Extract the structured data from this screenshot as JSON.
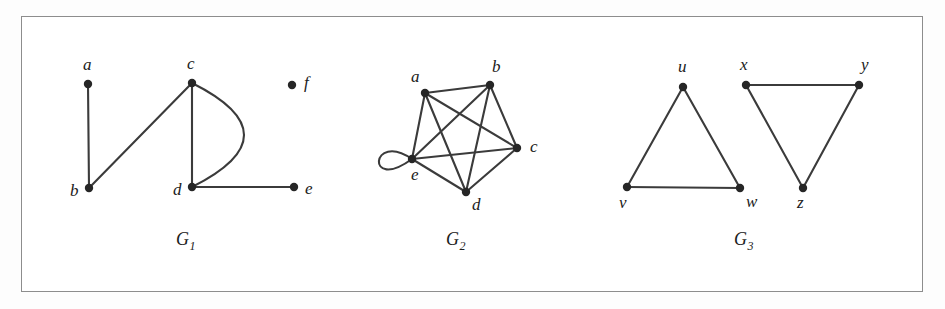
{
  "figure": {
    "background_color": "#fdfdfd",
    "frame_color": "#8d8d8d",
    "edge_color": "#3b3b3b",
    "vertex_color": "#262626",
    "graphs": [
      {
        "id": "G1",
        "label": "G",
        "subscript": "1",
        "label_x": 176,
        "label_y": 245,
        "vertices": [
          {
            "name": "a",
            "x": 88,
            "y": 84,
            "lx": 83,
            "ly": 70,
            "r": 4.2
          },
          {
            "name": "b",
            "x": 89,
            "y": 188,
            "lx": 70,
            "ly": 196,
            "r": 4.2
          },
          {
            "name": "c",
            "x": 192,
            "y": 83,
            "lx": 187,
            "ly": 69,
            "r": 4.2
          },
          {
            "name": "d",
            "x": 192,
            "y": 187,
            "lx": 173,
            "ly": 195,
            "r": 4.2
          },
          {
            "name": "e",
            "x": 294,
            "y": 187,
            "lx": 305,
            "ly": 194,
            "r": 4.2
          },
          {
            "name": "f",
            "x": 292,
            "y": 85,
            "lx": 304,
            "ly": 88,
            "r": 4.2
          }
        ],
        "edges": [
          {
            "from": "a",
            "to": "b",
            "type": "line"
          },
          {
            "from": "b",
            "to": "c",
            "type": "line"
          },
          {
            "from": "c",
            "to": "d",
            "type": "line"
          },
          {
            "from": "c",
            "to": "d",
            "type": "arc",
            "bulge": 52
          },
          {
            "from": "d",
            "to": "e",
            "type": "line"
          }
        ],
        "isolated_vertices": [
          "f"
        ]
      },
      {
        "id": "G2",
        "label": "G",
        "subscript": "2",
        "label_x": 446,
        "label_y": 245,
        "vertices": [
          {
            "name": "a",
            "x": 425,
            "y": 93,
            "lx": 411,
            "ly": 82,
            "r": 4.2
          },
          {
            "name": "b",
            "x": 490,
            "y": 85,
            "lx": 492,
            "ly": 72,
            "r": 4.2
          },
          {
            "name": "c",
            "x": 517,
            "y": 148,
            "lx": 530,
            "ly": 152,
            "r": 4.2
          },
          {
            "name": "d",
            "x": 466,
            "y": 192,
            "lx": 472,
            "ly": 210,
            "r": 4.2
          },
          {
            "name": "e",
            "x": 412,
            "y": 159,
            "lx": 411,
            "ly": 180,
            "r": 4.2
          }
        ],
        "edges": [
          {
            "from": "a",
            "to": "b",
            "type": "line"
          },
          {
            "from": "a",
            "to": "c",
            "type": "line"
          },
          {
            "from": "a",
            "to": "d",
            "type": "line"
          },
          {
            "from": "a",
            "to": "e",
            "type": "line"
          },
          {
            "from": "b",
            "to": "c",
            "type": "line"
          },
          {
            "from": "b",
            "to": "d",
            "type": "line"
          },
          {
            "from": "b",
            "to": "e",
            "type": "line"
          },
          {
            "from": "c",
            "to": "d",
            "type": "line"
          },
          {
            "from": "c",
            "to": "e",
            "type": "line"
          },
          {
            "from": "d",
            "to": "e",
            "type": "line"
          },
          {
            "from": "e",
            "to": "e",
            "type": "loop",
            "direction": "left",
            "size": 36
          }
        ],
        "isolated_vertices": []
      },
      {
        "id": "G3",
        "label": "G",
        "subscript": "3",
        "label_x": 734,
        "label_y": 245,
        "vertices": [
          {
            "name": "u",
            "x": 683,
            "y": 87,
            "lx": 678,
            "ly": 72,
            "r": 4.2
          },
          {
            "name": "v",
            "x": 627,
            "y": 187,
            "lx": 619,
            "ly": 208,
            "r": 4.2
          },
          {
            "name": "w",
            "x": 740,
            "y": 188,
            "lx": 746,
            "ly": 207,
            "r": 4.2
          },
          {
            "name": "x",
            "x": 746,
            "y": 85,
            "lx": 740,
            "ly": 70,
            "r": 4.2
          },
          {
            "name": "y",
            "x": 859,
            "y": 85,
            "lx": 861,
            "ly": 70,
            "r": 4.2
          },
          {
            "name": "z",
            "x": 803,
            "y": 188,
            "lx": 797,
            "ly": 208,
            "r": 4.2
          }
        ],
        "edges": [
          {
            "from": "u",
            "to": "v",
            "type": "line"
          },
          {
            "from": "u",
            "to": "w",
            "type": "line"
          },
          {
            "from": "v",
            "to": "w",
            "type": "line"
          },
          {
            "from": "x",
            "to": "y",
            "type": "line"
          },
          {
            "from": "x",
            "to": "z",
            "type": "line"
          },
          {
            "from": "y",
            "to": "z",
            "type": "line"
          }
        ],
        "isolated_vertices": []
      }
    ]
  }
}
